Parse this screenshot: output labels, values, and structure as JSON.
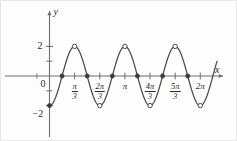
{
  "figure": {
    "title": "",
    "background_color": "#fdfdfd",
    "curve_color": "#4a4a4a",
    "axis_color": "#6e6e6e",
    "text_color": "#2b2b2b"
  },
  "axes": {
    "y_axis_label": "y",
    "x_axis_label": "x",
    "origin_label": "0",
    "y_ticks": [
      {
        "value": 2,
        "label": "2"
      },
      {
        "value": 1,
        "label": ""
      },
      {
        "value": -1,
        "label": ""
      },
      {
        "value": -2,
        "label": "−2"
      }
    ],
    "x_tick_labels": [
      {
        "value": 1.0471975512,
        "display": "π/3",
        "numerator": "π",
        "denominator": "3",
        "is_fraction": true
      },
      {
        "value": 2.0943951024,
        "display": "2π/3",
        "numerator": "2π",
        "denominator": "3",
        "is_fraction": true
      },
      {
        "value": 3.1415926536,
        "display": "π",
        "numerator": "π",
        "denominator": "",
        "is_fraction": false
      },
      {
        "value": 4.1887902048,
        "display": "4π/3",
        "numerator": "4π",
        "denominator": "3",
        "is_fraction": true
      },
      {
        "value": 5.235987756,
        "display": "5π/3",
        "numerator": "5π",
        "denominator": "3",
        "is_fraction": true
      },
      {
        "value": 6.2831853072,
        "display": "2π",
        "numerator": "2π",
        "denominator": "",
        "is_fraction": false
      }
    ]
  },
  "chart_data": {
    "type": "line",
    "title": "",
    "xlabel": "x",
    "ylabel": "y",
    "function": "y = -2cos(3x)",
    "amplitude": 2,
    "period": 2.0943951024,
    "frequency": 3,
    "xlim": [
      -0.62,
      6.98
    ],
    "ylim": [
      -2.6,
      2.6
    ],
    "grid": false,
    "legend": null,
    "x_ticks": [
      1.0471975512,
      2.0943951024,
      3.1415926536,
      4.1887902048,
      5.235987756,
      6.2831853072
    ],
    "x_tick_labels": [
      "π/3",
      "2π/3",
      "π",
      "4π/3",
      "5π/3",
      "2π"
    ],
    "y_ticks": [
      -2,
      -1,
      1,
      2
    ],
    "y_tick_labels": [
      "−2",
      "",
      "",
      "2"
    ],
    "minor_x_ticks": [
      -0.5235987756,
      0.5235987756,
      1.5707963268,
      2.617993878,
      3.6651914292,
      4.7123889804,
      5.7595865316
    ],
    "markers": {
      "open_circle_points": [
        {
          "x": 1.0471975512,
          "y": 2.0,
          "type": "maximum"
        },
        {
          "x": 2.0943951024,
          "y": -2.0,
          "type": "minimum"
        },
        {
          "x": 3.1415926536,
          "y": 2.0,
          "type": "maximum"
        },
        {
          "x": 4.1887902048,
          "y": -2.0,
          "type": "minimum"
        },
        {
          "x": 5.235987756,
          "y": 2.0,
          "type": "maximum"
        },
        {
          "x": 6.2831853072,
          "y": -2.0,
          "type": "minimum"
        }
      ],
      "filled_dot_points": [
        {
          "x": 0.5235987756,
          "y": 0.0,
          "type": "zero-crossing"
        },
        {
          "x": 1.5707963268,
          "y": 0.0,
          "type": "zero-crossing"
        },
        {
          "x": 2.617993878,
          "y": 0.0,
          "type": "zero-crossing"
        },
        {
          "x": 3.6651914292,
          "y": 0.0,
          "type": "zero-crossing"
        },
        {
          "x": 4.7123889804,
          "y": 0.0,
          "type": "zero-crossing"
        },
        {
          "x": 5.7595865316,
          "y": 0.0,
          "type": "zero-crossing"
        },
        {
          "x": 0.0,
          "y": -2.0,
          "type": "endpoint-minimum"
        }
      ]
    }
  }
}
